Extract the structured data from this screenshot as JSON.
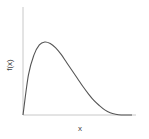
{
  "chart_data": {
    "type": "line",
    "title": "",
    "xlabel": "x",
    "ylabel": "f(x)",
    "grid": false,
    "legend": null,
    "ticks": false,
    "series": [
      {
        "name": "f(x)",
        "description": "right-skewed unimodal density curve (rises steeply from 0, peaks early, long right tail decaying to 0)",
        "x": [
          0,
          0.05,
          0.1,
          0.15,
          0.2,
          0.25,
          0.3,
          0.35,
          0.4,
          0.45,
          0.5,
          0.55,
          0.6,
          0.65,
          0.7,
          0.75,
          0.8,
          0.85,
          0.9,
          0.95,
          1.0
        ],
        "values": [
          0,
          0.55,
          0.82,
          0.96,
          1.0,
          0.98,
          0.92,
          0.83,
          0.72,
          0.61,
          0.5,
          0.39,
          0.29,
          0.2,
          0.13,
          0.07,
          0.03,
          0.01,
          0.0,
          0.0,
          0.0
        ]
      }
    ],
    "xlim": [
      0,
      1
    ],
    "ylim": [
      0,
      1.0
    ]
  },
  "colors": {
    "axis": "#c8c8c8",
    "curve": "#555555",
    "text": "#444444"
  }
}
